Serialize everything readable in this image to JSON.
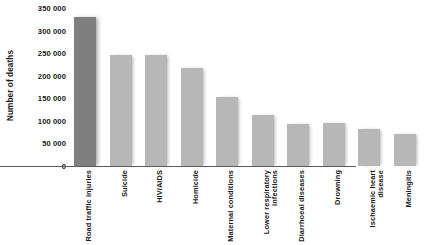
{
  "chart_data": {
    "type": "bar",
    "title": "",
    "subtitle": "",
    "xlabel": "",
    "ylabel": "Number of deaths",
    "ylim": [
      0,
      350000
    ],
    "ytick_values": [
      0,
      50000,
      100000,
      150000,
      200000,
      250000,
      300000,
      350000
    ],
    "ytick_labels": [
      "0",
      "50 000",
      "100 000",
      "150 000",
      "200 000",
      "250 000",
      "300 000",
      "350 000"
    ],
    "grid": false,
    "legend": "none",
    "categories": [
      "Road traffic injuries",
      "Suicide",
      "HIV/AIDS",
      "Homicide",
      "Maternal conditions",
      "Lower respiratory infections",
      "Diarrhoeal diseases",
      "Drowning",
      "Ischaemic heart disease",
      "Meningitis"
    ],
    "category_lines": [
      [
        "Road traffic injuries"
      ],
      [
        "Suicide"
      ],
      [
        "HIV/AIDS"
      ],
      [
        "Homicide"
      ],
      [
        "Maternal conditions"
      ],
      [
        "Lower respiratory",
        "infections"
      ],
      [
        "Diarrhoeal diseases"
      ],
      [
        "Drowning"
      ],
      [
        "Ischaemic heart",
        "disease"
      ],
      [
        "Meningitis"
      ]
    ],
    "values": [
      330000,
      247000,
      245000,
      217000,
      153000,
      113000,
      92000,
      96000,
      83000,
      71000
    ],
    "colors": {
      "bar": "#b7b7b7",
      "bar_highlight": "#7f7f7f",
      "axis": "#5c5c5c",
      "text": "#1a1a1a",
      "background": "#ffffff"
    },
    "highlight_index": 0
  }
}
